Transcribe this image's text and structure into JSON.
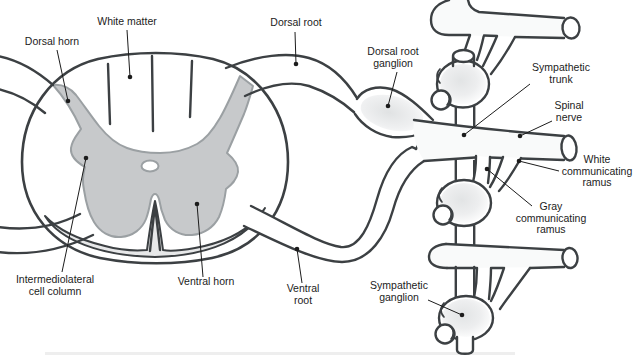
{
  "figure": {
    "kind": "anatomical line diagram"
  },
  "colors": {
    "outline": "#3c4043",
    "gray_matter_fill": "#c7c9cb",
    "gray_matter_outline": "#9ba0a3",
    "marginal_band": "#e7e8e9",
    "ganglion_shade": "#e3e5e6",
    "label_text": "#1c1c1c",
    "background": "#ffffff"
  },
  "labels": [
    {
      "id": "dorsal-horn",
      "lines": [
        "Dorsal horn"
      ],
      "x": 52,
      "y": 45,
      "leader": {
        "x1": 57,
        "y1": 50,
        "x2": 68,
        "y2": 101
      }
    },
    {
      "id": "white-matter",
      "lines": [
        "White matter"
      ],
      "x": 127,
      "y": 25,
      "leader": {
        "x1": 127,
        "y1": 30,
        "x2": 130,
        "y2": 77
      }
    },
    {
      "id": "dorsal-root",
      "lines": [
        "Dorsal root"
      ],
      "x": 296,
      "y": 26,
      "leader": {
        "x1": 295,
        "y1": 32,
        "x2": 296,
        "y2": 64
      }
    },
    {
      "id": "dorsal-root-ganglion",
      "lines": [
        "Dorsal root",
        "ganglion"
      ],
      "x": 393,
      "y": 55,
      "leader": {
        "x1": 397,
        "y1": 72,
        "x2": 388,
        "y2": 106
      }
    },
    {
      "id": "sympathetic-trunk",
      "lines": [
        "Sympathetic",
        "trunk"
      ],
      "x": 561,
      "y": 71,
      "leader": {
        "x1": 530,
        "y1": 84,
        "x2": 464,
        "y2": 135
      }
    },
    {
      "id": "spinal-nerve",
      "lines": [
        "Spinal",
        "nerve"
      ],
      "x": 569,
      "y": 109,
      "leader": {
        "x1": 552,
        "y1": 121,
        "x2": 520,
        "y2": 136
      }
    },
    {
      "id": "white-communicating-ramus",
      "lines": [
        "White",
        "communicating",
        "ramus"
      ],
      "x": 597,
      "y": 163,
      "leader": {
        "x1": 559,
        "y1": 171,
        "x2": 519,
        "y2": 161
      }
    },
    {
      "id": "gray-communicating-ramus",
      "lines": [
        "Gray",
        "communicating",
        "ramus"
      ],
      "x": 551,
      "y": 210,
      "leader": {
        "x1": 532,
        "y1": 206,
        "x2": 487,
        "y2": 169
      }
    },
    {
      "id": "sympathetic-ganglion",
      "lines": [
        "Sympathetic",
        "ganglion"
      ],
      "x": 399,
      "y": 289,
      "leader": {
        "x1": 428,
        "y1": 300,
        "x2": 462,
        "y2": 315
      }
    },
    {
      "id": "ventral-root",
      "lines": [
        "Ventral",
        "root"
      ],
      "x": 303,
      "y": 292,
      "leader": {
        "x1": 302,
        "y1": 283,
        "x2": 297,
        "y2": 249
      }
    },
    {
      "id": "ventral-horn",
      "lines": [
        "Ventral horn"
      ],
      "x": 206,
      "y": 285,
      "leader": {
        "x1": 203,
        "y1": 277,
        "x2": 197,
        "y2": 204
      }
    },
    {
      "id": "intermediolateral-cell-column",
      "lines": [
        "Intermediolateral",
        "cell column"
      ],
      "x": 55,
      "y": 283,
      "leader": {
        "x1": 62,
        "y1": 272,
        "x2": 86,
        "y2": 158
      }
    }
  ],
  "label_style": {
    "line_height": 11.5,
    "dot_radius": 2.3
  }
}
